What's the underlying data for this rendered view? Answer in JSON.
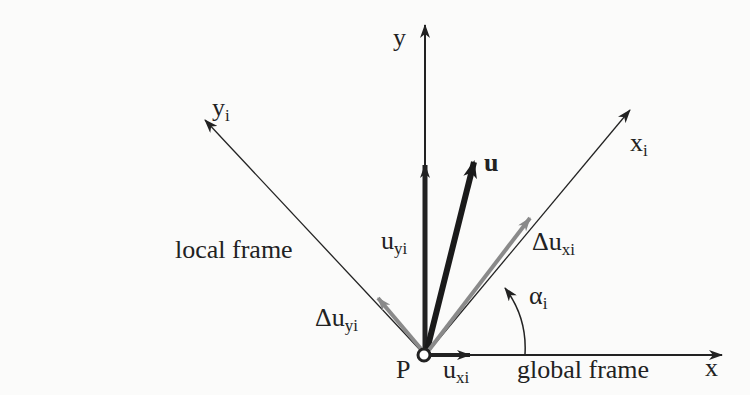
{
  "diagram": {
    "labels": {
      "y_axis": "y",
      "x_axis": "x",
      "yi_axis": {
        "base": "y",
        "sub": "i"
      },
      "xi_axis": {
        "base": "x",
        "sub": "i"
      },
      "u_vector": "u",
      "uyi": {
        "base": "u",
        "sub": "yi"
      },
      "uxi": {
        "base": "u",
        "sub": "xi"
      },
      "delta_uxi": {
        "base": "Δu",
        "sub": "xi"
      },
      "delta_uyi": {
        "base": "Δu",
        "sub": "yi"
      },
      "alpha": {
        "base": "α",
        "sub": "i"
      },
      "point": "P",
      "local_frame": "local frame",
      "global_frame": "global frame"
    },
    "colors": {
      "axis": "#222222",
      "vector_u": "#1a1a1a",
      "local_components": "#8a8a8a",
      "background": "#fbfbfa"
    }
  }
}
